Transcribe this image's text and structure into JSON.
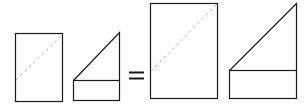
{
  "diagram": {
    "operator": "=",
    "colors": {
      "stroke": "#1a1a1a",
      "dashed": "#b0b0b0",
      "background": "#ffffff"
    },
    "shapes": [
      {
        "id": "small-rectangle",
        "kind": "rectangle-with-dashed-diagonal"
      },
      {
        "id": "small-triangle-on-rectangle",
        "kind": "triangle-over-rectangle"
      },
      {
        "id": "large-rectangle",
        "kind": "rectangle-with-dashed-diagonal"
      },
      {
        "id": "large-triangle-on-rectangle",
        "kind": "triangle-over-rectangle"
      }
    ]
  }
}
